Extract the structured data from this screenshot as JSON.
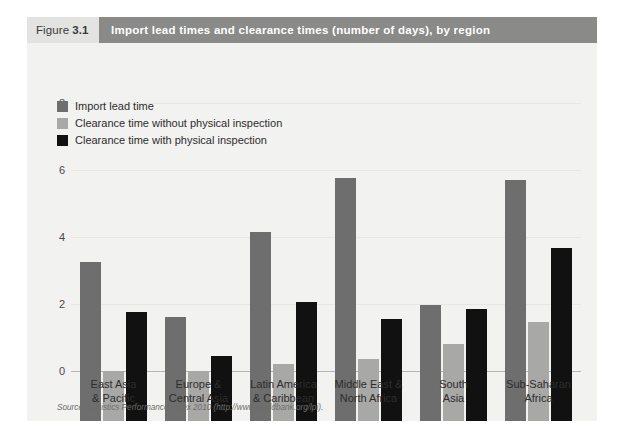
{
  "figure": {
    "label_word": "Figure",
    "label_number": "3.1",
    "title": "Import lead times and clearance times (number of days), by region",
    "source": "Source: Logistics Performance Index 2010 (http://www.worldbank.org/lpi)."
  },
  "colors": {
    "series_import_lead_time": "#6e6e6e",
    "series_clearance_without": "#a8a8a6",
    "series_clearance_with": "#111111",
    "banner": "#8a8a88",
    "figure_number_bg": "#e3e3e1",
    "panel_bg": "#f2f2f0",
    "gridline": "#e7e7e5",
    "axis_text": "#4a4a4a"
  },
  "chart_data": {
    "type": "bar",
    "title": "Import lead times and clearance times (number of days), by region",
    "xlabel": "",
    "ylabel": "",
    "ylim": [
      0,
      8
    ],
    "yticks": [
      0,
      2,
      4,
      6,
      8
    ],
    "ytick_labels": [
      "0",
      "2",
      "4",
      "6",
      "8"
    ],
    "grid": true,
    "legend_position": "top-left",
    "categories": [
      "East Asia & Pacific",
      "Europe & Central Asia",
      "Latin America & Caribbean",
      "Middle East & North Africa",
      "South Asia",
      "Sub-Saharan Africa"
    ],
    "category_lines": [
      [
        "East Asia",
        "& Pacific"
      ],
      [
        "Europe &",
        "Central Asia"
      ],
      [
        "Latin America",
        "& Caribbean"
      ],
      [
        "Middle East &",
        "North Africa"
      ],
      [
        "South",
        "Asia"
      ],
      [
        "Sub-Saharan",
        "Africa"
      ]
    ],
    "series": [
      {
        "name": "Import lead time",
        "color": "#6e6e6e",
        "values": [
          4.75,
          3.1,
          5.65,
          7.25,
          3.45,
          7.2
        ]
      },
      {
        "name": "Clearance time without physical inspection",
        "color": "#a8a8a6",
        "values": [
          1.5,
          1.5,
          1.7,
          1.85,
          2.3,
          2.95
        ]
      },
      {
        "name": "Clearance time with physical inspection",
        "color": "#111111",
        "values": [
          3.25,
          1.95,
          3.55,
          3.05,
          3.35,
          5.15
        ]
      }
    ]
  }
}
